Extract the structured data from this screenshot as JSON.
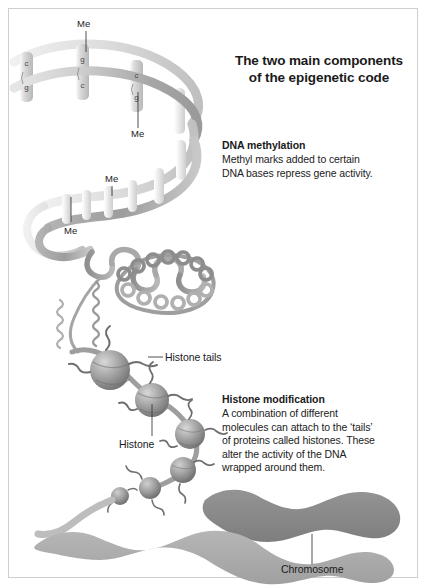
{
  "figure": {
    "title": "The two main components\nof the epigenetic code",
    "title_line1": "The two main components",
    "title_line2": "of the epigenetic code",
    "background_color": "#ffffff",
    "border_color": "#cfcfcf"
  },
  "sections": [
    {
      "id": "dna-methylation",
      "heading": "DNA methylation",
      "body_line1": "Methyl marks added to certain",
      "body_line2": "DNA bases repress gene activity.",
      "body": "Methyl marks added to certain DNA bases repress gene activity."
    },
    {
      "id": "histone-modification",
      "heading": "Histone modification",
      "body_line1": "A combination of different",
      "body_line2": "molecules can attach to the ‘tails’",
      "body_line3": "of proteins called histones. These",
      "body_line4": "alter the activity of the DNA",
      "body_line5": "wrapped around them.",
      "body": "A combination of different molecules can attach to the ‘tails’ of proteins called histones. These alter the activity of the DNA wrapped around them."
    }
  ],
  "callouts": {
    "histone_tails": "Histone tails",
    "histone": "Histone",
    "chromosome": "Chromosome"
  },
  "methyl_marks": [
    {
      "id": "me-1",
      "label": "Me",
      "x": 84,
      "y": 18
    },
    {
      "id": "me-2",
      "label": "Me",
      "x": 138,
      "y": 135
    },
    {
      "id": "me-3",
      "label": "Me",
      "x": 108,
      "y": 200
    },
    {
      "id": "me-4",
      "label": "Me",
      "x": 66,
      "y": 228
    }
  ],
  "base_pairs": [
    {
      "id": "bp-1",
      "top": "c",
      "bottom": "g"
    },
    {
      "id": "bp-2",
      "top": "g",
      "bottom": "c"
    },
    {
      "id": "bp-3",
      "top": "c",
      "bottom": "g"
    }
  ],
  "colors": {
    "dna_strand_dark": "#9b9b9b",
    "dna_strand_light": "#d2d2d2",
    "rung": "#c9c9c9",
    "histone_bead": "#9a9a9a",
    "chromatid_dark": "#8a8a8a",
    "chromatid_light": "#ababab",
    "text": "#1a1a1a"
  }
}
